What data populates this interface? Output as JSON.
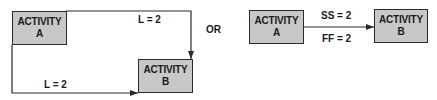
{
  "diagram": {
    "left": {
      "activity_a": {
        "line1": "ACTIVITY",
        "line2": "A"
      },
      "activity_b": {
        "line1": "ACTIVITY",
        "line2": "B"
      },
      "top_lag_label": "L = 2",
      "bottom_lag_label": "L = 2",
      "relationships": [
        {
          "from": "A",
          "to": "B",
          "type": "finish-to-finish",
          "lag": "L = 2"
        },
        {
          "from": "A",
          "to": "B",
          "type": "start-to-start",
          "lag": "L = 2"
        }
      ]
    },
    "separator": "OR",
    "right": {
      "activity_a": {
        "line1": "ACTIVITY",
        "line2": "A"
      },
      "activity_b": {
        "line1": "ACTIVITY",
        "line2": "B"
      },
      "upper_label": "SS = 2",
      "lower_label": "FF = 2"
    },
    "colors": {
      "box_fill": "#c8c8c8",
      "line": "#2a2a2a",
      "text": "#1a1a1a"
    }
  }
}
